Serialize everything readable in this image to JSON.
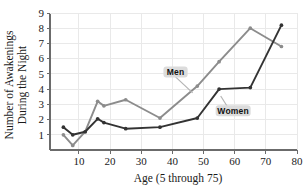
{
  "chart_data": {
    "type": "line",
    "title": "",
    "xlabel": "Age (5 through 75)",
    "ylabel_line1": "Number of Awakenings",
    "ylabel_line2": "During the Night",
    "xlim": [
      0.7,
      80
    ],
    "ylim": [
      0,
      9
    ],
    "xticks": [
      10,
      20,
      30,
      40,
      50,
      60,
      70,
      80
    ],
    "yticks": [
      1,
      2,
      3,
      4,
      5,
      6,
      7,
      8,
      9
    ],
    "grid": true,
    "legend_position": "inline-callout",
    "series": [
      {
        "name": "Men",
        "color": "#8c8c8c",
        "label_x": 41,
        "label_y": 5.0,
        "leader_to_x": 46.5,
        "leader_to_y": 3.75,
        "x": [
          5,
          8,
          12,
          16,
          18,
          25,
          36,
          48,
          55,
          65,
          75
        ],
        "y": [
          1.0,
          0.3,
          1.2,
          3.2,
          2.9,
          3.3,
          2.1,
          4.2,
          5.8,
          8.0,
          6.8
        ]
      },
      {
        "name": "Women",
        "color": "#333333",
        "label_x": 59.5,
        "label_y": 2.45,
        "leader_to_x": 55.5,
        "leader_to_y": 3.55,
        "x": [
          5,
          8,
          12,
          16,
          18,
          25,
          36,
          48,
          55,
          65,
          75
        ],
        "y": [
          1.5,
          1.0,
          1.2,
          2.05,
          1.8,
          1.4,
          1.5,
          2.1,
          4.0,
          4.1,
          8.2
        ]
      }
    ],
    "xtick_labels": [
      "10",
      "20",
      "30",
      "40",
      "50",
      "60",
      "70",
      "80"
    ],
    "ytick_labels": [
      "1",
      "2",
      "3",
      "4",
      "5",
      "6",
      "7",
      "8",
      "9"
    ]
  }
}
